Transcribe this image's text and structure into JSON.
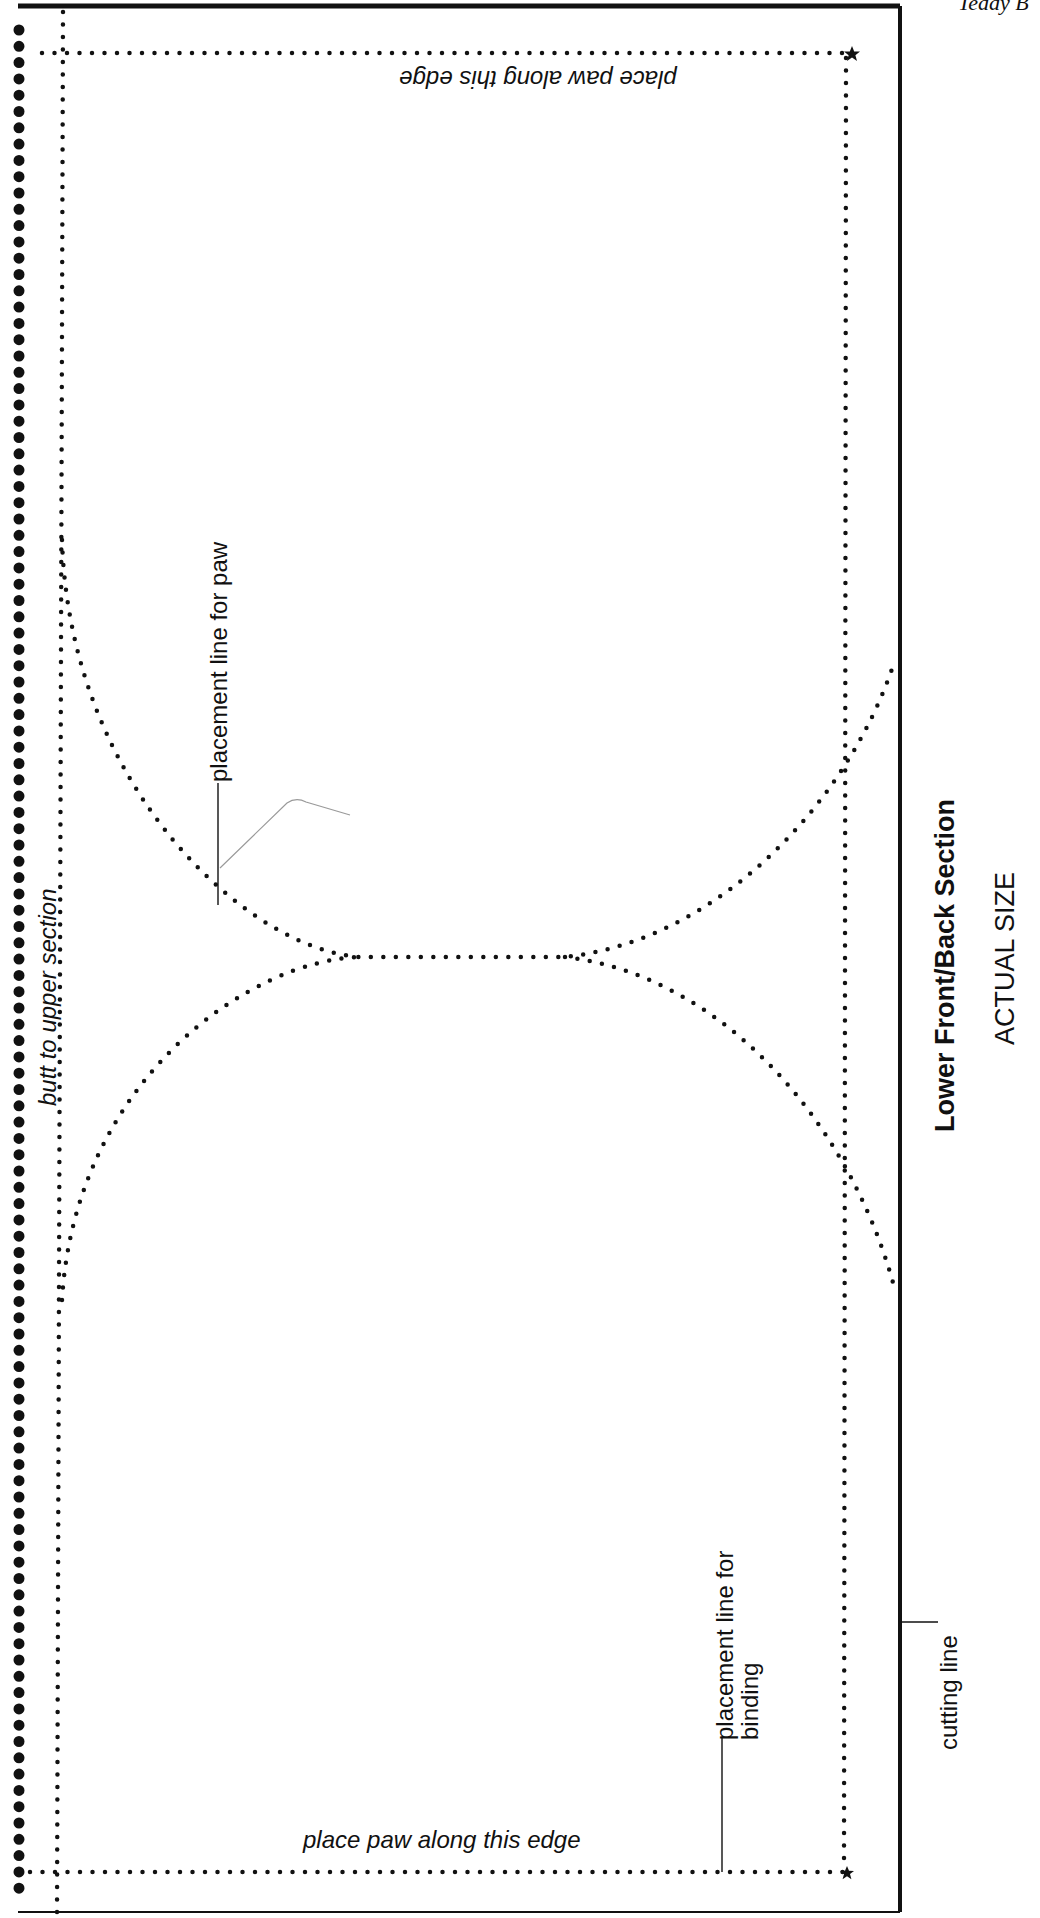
{
  "header": {
    "page_label": "Teddy B"
  },
  "pattern": {
    "title": "Lower Front/Back Section",
    "subtitle": "ACTUAL SIZE",
    "labels": {
      "top_edge": "place paw along this edge",
      "bottom_edge": "place paw along this edge",
      "left_edge": "butt to upper section",
      "paw_placement": "placement line for paw",
      "binding_placement_line1": "placement line for",
      "binding_placement_line2": "binding",
      "cutting_line": "cutting line"
    },
    "colors": {
      "ink": "#111111",
      "paper": "#ffffff",
      "pencil": "#9a9a9a"
    }
  }
}
